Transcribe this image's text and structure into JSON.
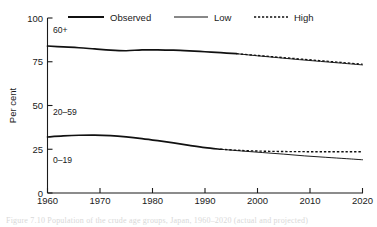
{
  "figure": {
    "caption": "Figure 7.10   Population of the crude age groups, Japan, 1960–2020 (actual and projected)"
  },
  "chart_data": {
    "type": "line",
    "title": "",
    "subtitle": "",
    "xlabel": "",
    "ylabel": "Per cent",
    "xlim": [
      1960,
      2020
    ],
    "ylim": [
      0,
      100
    ],
    "xticks": [
      1960,
      1970,
      1980,
      1990,
      2000,
      2010,
      2020
    ],
    "xticklabels": [
      "1960",
      "1970",
      "1980",
      "1990",
      "2000",
      "2010",
      "2020"
    ],
    "yticks": [
      0,
      25,
      50,
      75,
      100
    ],
    "yticklabels": [
      "0",
      "25",
      "50",
      "75",
      "100"
    ],
    "grid": false,
    "legend_position": "top",
    "legend": [
      {
        "name": "Observed",
        "style": "solid-thick"
      },
      {
        "name": "Low",
        "style": "solid-thin"
      },
      {
        "name": "High",
        "style": "dotted"
      }
    ],
    "annotations": [
      {
        "text": "60+",
        "x": 1962,
        "y": 88
      },
      {
        "text": "20–59",
        "x": 1962,
        "y": 45
      },
      {
        "text": "0–19",
        "x": 1962,
        "y": 21
      }
    ],
    "series": [
      {
        "name": "Observed",
        "group": "upper",
        "style": "solid-thick",
        "x": [
          1960,
          1963,
          1966,
          1969,
          1972,
          1975,
          1978,
          1981,
          1984,
          1987,
          1990,
          1993,
          1996
        ],
        "values": [
          84.0,
          83.5,
          83.0,
          82.3,
          81.6,
          81.3,
          81.8,
          81.8,
          81.6,
          81.2,
          80.7,
          80.2,
          79.6
        ]
      },
      {
        "name": "Low",
        "group": "upper",
        "style": "solid-thin",
        "x": [
          1996,
          2000,
          2004,
          2008,
          2012,
          2016,
          2020
        ],
        "values": [
          79.6,
          78.4,
          77.3,
          76.2,
          75.2,
          74.2,
          73.2
        ]
      },
      {
        "name": "High",
        "group": "upper",
        "style": "dotted",
        "x": [
          1996,
          2000,
          2004,
          2008,
          2012,
          2016,
          2020
        ],
        "values": [
          79.6,
          78.6,
          77.6,
          76.6,
          75.6,
          74.6,
          73.6
        ]
      },
      {
        "name": "Observed",
        "group": "lower",
        "style": "solid-thick",
        "x": [
          1960,
          1963,
          1966,
          1969,
          1972,
          1975,
          1978,
          1981,
          1984,
          1987,
          1990,
          1993
        ],
        "values": [
          32.0,
          32.6,
          33.0,
          33.1,
          32.8,
          32.1,
          31.1,
          29.9,
          28.6,
          27.2,
          25.9,
          25.0
        ]
      },
      {
        "name": "Low",
        "group": "lower",
        "style": "solid-thin",
        "x": [
          1993,
          1997,
          2001,
          2005,
          2009,
          2013,
          2017,
          2020
        ],
        "values": [
          25.0,
          24.0,
          23.1,
          22.2,
          21.2,
          20.4,
          19.6,
          19.0
        ]
      },
      {
        "name": "High",
        "group": "lower",
        "style": "dotted",
        "x": [
          1993,
          1997,
          2001,
          2005,
          2009,
          2013,
          2017,
          2020
        ],
        "values": [
          25.0,
          24.3,
          23.9,
          23.7,
          23.6,
          23.6,
          23.6,
          23.6
        ]
      }
    ]
  }
}
